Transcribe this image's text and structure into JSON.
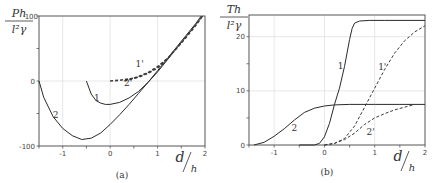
{
  "chart_data": [
    {
      "type": "line",
      "panel_caption": "(a)",
      "ylabel_num": "Ph",
      "ylabel_den": "l²γ",
      "xlabel_num": "d",
      "xlabel_den": "h",
      "xlim": [
        -1.5,
        2
      ],
      "ylim": [
        -100,
        100
      ],
      "xticks": [
        -1,
        0,
        1,
        2
      ],
      "xtick_labels": [
        "-1",
        "0",
        "1",
        "2"
      ],
      "yticks": [
        -100,
        0,
        100
      ],
      "ytick_labels": [
        "-100",
        "0",
        "100"
      ],
      "grid": true,
      "series": [
        {
          "name": "1",
          "style": "solid",
          "x": [
            -0.5,
            -0.4,
            -0.3,
            -0.2,
            -0.1,
            0.0,
            0.2,
            0.4,
            0.6,
            0.8,
            1.0,
            1.2,
            1.4,
            1.6,
            1.8,
            1.95
          ],
          "y": [
            0,
            -20,
            -30,
            -34,
            -36,
            -36,
            -33,
            -26,
            -16,
            -2,
            14,
            32,
            50,
            68,
            86,
            100
          ]
        },
        {
          "name": "2",
          "style": "solid",
          "x": [
            -1.5,
            -1.4,
            -1.2,
            -1.0,
            -0.8,
            -0.6,
            -0.4,
            -0.2,
            0.0,
            0.2,
            0.4,
            0.6,
            0.8,
            1.0,
            1.2,
            1.4,
            1.6,
            1.8,
            1.92
          ],
          "y": [
            0,
            -25,
            -55,
            -73,
            -84,
            -90,
            -88,
            -80,
            -67,
            -52,
            -36,
            -19,
            -2,
            16,
            34,
            52,
            70,
            88,
            100
          ]
        },
        {
          "name": "1'",
          "style": "dashed-bold",
          "x": [
            0.0,
            0.2,
            0.4,
            0.6,
            0.8,
            1.0,
            1.2,
            1.4,
            1.6,
            1.8,
            1.95
          ],
          "y": [
            0,
            1,
            3,
            6,
            12,
            20,
            34,
            50,
            67,
            85,
            100
          ]
        },
        {
          "name": "2'",
          "style": "dashed-bold",
          "x": [
            0.3,
            0.45,
            0.6,
            0.8,
            1.0,
            1.2
          ],
          "y": [
            0,
            3,
            7,
            13,
            22,
            34
          ]
        }
      ],
      "annotations": [
        {
          "text": "1",
          "x": -0.28,
          "y": -30
        },
        {
          "text": "2",
          "x": -1.15,
          "y": -57
        },
        {
          "text": "1'",
          "x": 0.62,
          "y": 22
        },
        {
          "text": "2'",
          "x": 0.38,
          "y": -8
        }
      ]
    },
    {
      "type": "line",
      "panel_caption": "(b)",
      "ylabel_num": "Th",
      "ylabel_den": "l²γ",
      "xlabel_num": "d",
      "xlabel_den": "h",
      "xlim": [
        -1.5,
        2
      ],
      "ylim": [
        0,
        24
      ],
      "xticks": [
        -1,
        0,
        1,
        2
      ],
      "xtick_labels": [
        "-1",
        "0",
        "1",
        "2"
      ],
      "yticks": [
        0,
        10,
        20
      ],
      "ytick_labels": [
        "0",
        "10",
        "20"
      ],
      "grid": true,
      "series": [
        {
          "name": "1",
          "style": "solid",
          "x": [
            -0.5,
            -0.2,
            -0.1,
            0.0,
            0.1,
            0.2,
            0.3,
            0.4,
            0.5,
            0.55,
            0.6,
            0.7,
            0.9,
            1.2,
            2.0
          ],
          "y": [
            0,
            0,
            0.3,
            1.5,
            4,
            7.5,
            10.5,
            14.5,
            19.5,
            21.5,
            22.5,
            22.9,
            23,
            23,
            23
          ]
        },
        {
          "name": "2",
          "style": "solid",
          "x": [
            -1.4,
            -1.2,
            -1.0,
            -0.8,
            -0.6,
            -0.4,
            -0.2,
            0.0,
            0.2,
            0.5,
            1.0,
            1.5,
            2.0
          ],
          "y": [
            0,
            0.5,
            1.6,
            3,
            4.6,
            6,
            6.8,
            7.2,
            7.4,
            7.5,
            7.5,
            7.5,
            7.5
          ]
        },
        {
          "name": "1'",
          "style": "dashed",
          "x": [
            0.0,
            0.2,
            0.4,
            0.6,
            0.8,
            1.0,
            1.2,
            1.4,
            1.6,
            1.8,
            2.0
          ],
          "y": [
            0,
            0.3,
            1.2,
            3.5,
            7,
            10.5,
            14,
            17,
            19.3,
            20.9,
            22
          ]
        },
        {
          "name": "2'",
          "style": "dashed",
          "x": [
            0.0,
            0.2,
            0.4,
            0.6,
            0.8,
            1.0,
            1.2,
            1.4,
            1.6,
            1.8
          ],
          "y": [
            0,
            0.3,
            1,
            2.2,
            3.8,
            5,
            5.8,
            6.5,
            7,
            7.5
          ]
        }
      ],
      "annotations": [
        {
          "text": "1",
          "x": 0.32,
          "y": 14
        },
        {
          "text": "2",
          "x": -0.6,
          "y": 2.6
        },
        {
          "text": "1'",
          "x": 1.15,
          "y": 13.8
        },
        {
          "text": "2'",
          "x": 0.92,
          "y": 1.8
        }
      ]
    }
  ]
}
